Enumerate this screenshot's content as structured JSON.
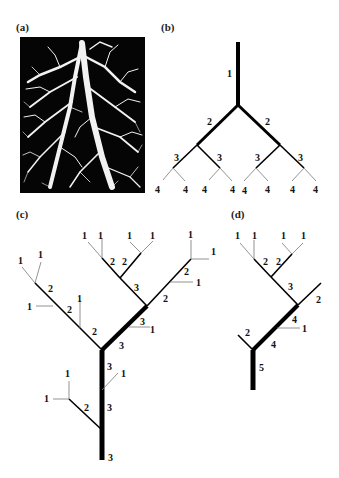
{
  "panels": {
    "a": {
      "label": "(a)",
      "caption": "root system photograph"
    },
    "b": {
      "label": "(b)"
    },
    "c": {
      "label": "(c)"
    },
    "d": {
      "label": "(d)"
    }
  },
  "tree_b": {
    "description": "Symmetric binary tree, Strahler ordering",
    "segments": [
      {
        "x1": 238,
        "y1": 42,
        "x2": 238,
        "y2": 105,
        "w": 4
      },
      {
        "x1": 238,
        "y1": 105,
        "x2": 197,
        "y2": 145,
        "w": 3
      },
      {
        "x1": 238,
        "y1": 105,
        "x2": 280,
        "y2": 145,
        "w": 3
      },
      {
        "x1": 197,
        "y1": 145,
        "x2": 173,
        "y2": 168,
        "w": 1.6
      },
      {
        "x1": 197,
        "y1": 145,
        "x2": 220,
        "y2": 168,
        "w": 1.6
      },
      {
        "x1": 280,
        "y1": 145,
        "x2": 256,
        "y2": 168,
        "w": 1.6
      },
      {
        "x1": 280,
        "y1": 145,
        "x2": 304,
        "y2": 168,
        "w": 1.6
      },
      {
        "x1": 173,
        "y1": 168,
        "x2": 163,
        "y2": 180,
        "w": 0.8
      },
      {
        "x1": 173,
        "y1": 168,
        "x2": 185,
        "y2": 181,
        "w": 0.8
      },
      {
        "x1": 220,
        "y1": 168,
        "x2": 209,
        "y2": 180,
        "w": 0.8
      },
      {
        "x1": 220,
        "y1": 168,
        "x2": 232,
        "y2": 181,
        "w": 0.8
      },
      {
        "x1": 256,
        "y1": 168,
        "x2": 244,
        "y2": 181,
        "w": 0.8
      },
      {
        "x1": 256,
        "y1": 168,
        "x2": 268,
        "y2": 181,
        "w": 0.8
      },
      {
        "x1": 304,
        "y1": 168,
        "x2": 292,
        "y2": 181,
        "w": 0.8
      },
      {
        "x1": 304,
        "y1": 168,
        "x2": 316,
        "y2": 181,
        "w": 0.8
      }
    ],
    "labels": [
      {
        "x": 227,
        "y": 77,
        "t": "1"
      },
      {
        "x": 207,
        "y": 125,
        "t": "2"
      },
      {
        "x": 265,
        "y": 125,
        "t": "2"
      },
      {
        "x": 174,
        "y": 161,
        "t": "3"
      },
      {
        "x": 217,
        "y": 161,
        "t": "3"
      },
      {
        "x": 255,
        "y": 161,
        "t": "3"
      },
      {
        "x": 298,
        "y": 161,
        "t": "3"
      },
      {
        "x": 155,
        "y": 193,
        "t": "4"
      },
      {
        "x": 183,
        "y": 193,
        "t": "4"
      },
      {
        "x": 202,
        "y": 193,
        "t": "4"
      },
      {
        "x": 230,
        "y": 193,
        "t": "4"
      },
      {
        "x": 242,
        "y": 194,
        "t": "4"
      },
      {
        "x": 265,
        "y": 193,
        "t": "4"
      },
      {
        "x": 290,
        "y": 193,
        "t": "4"
      },
      {
        "x": 313,
        "y": 193,
        "t": "4"
      }
    ]
  },
  "tree_c": {
    "description": "Irregular tree with stream orders",
    "segments": [
      {
        "x1": 102,
        "y1": 460,
        "x2": 102,
        "y2": 350,
        "w": 5
      },
      {
        "x1": 102,
        "y1": 350,
        "x2": 147,
        "y2": 306,
        "w": 4.5
      },
      {
        "x1": 102,
        "y1": 350,
        "x2": 35,
        "y2": 283,
        "w": 1.6
      },
      {
        "x1": 35,
        "y1": 283,
        "x2": 22,
        "y2": 267,
        "w": 0.8
      },
      {
        "x1": 35,
        "y1": 283,
        "x2": 41,
        "y2": 262,
        "w": 0.8
      },
      {
        "x1": 53,
        "y1": 306,
        "x2": 36,
        "y2": 306,
        "w": 0.8
      },
      {
        "x1": 80,
        "y1": 328,
        "x2": 80,
        "y2": 300,
        "w": 0.8
      },
      {
        "x1": 147,
        "y1": 306,
        "x2": 120,
        "y2": 278,
        "w": 1.6
      },
      {
        "x1": 120,
        "y1": 278,
        "x2": 102,
        "y2": 258,
        "w": 1.6
      },
      {
        "x1": 102,
        "y1": 258,
        "x2": 88,
        "y2": 242,
        "w": 0.8
      },
      {
        "x1": 102,
        "y1": 258,
        "x2": 102,
        "y2": 238,
        "w": 0.8
      },
      {
        "x1": 120,
        "y1": 278,
        "x2": 141,
        "y2": 253,
        "w": 1.6
      },
      {
        "x1": 141,
        "y1": 253,
        "x2": 130,
        "y2": 242,
        "w": 0.8
      },
      {
        "x1": 141,
        "y1": 253,
        "x2": 153,
        "y2": 241,
        "w": 0.8
      },
      {
        "x1": 147,
        "y1": 306,
        "x2": 191,
        "y2": 259,
        "w": 1.6
      },
      {
        "x1": 191,
        "y1": 259,
        "x2": 191,
        "y2": 240,
        "w": 0.8
      },
      {
        "x1": 191,
        "y1": 259,
        "x2": 209,
        "y2": 259,
        "w": 0.8
      },
      {
        "x1": 170,
        "y1": 282,
        "x2": 193,
        "y2": 282,
        "w": 0.8
      },
      {
        "x1": 129,
        "y1": 327,
        "x2": 150,
        "y2": 327,
        "w": 0.8
      },
      {
        "x1": 102,
        "y1": 390,
        "x2": 118,
        "y2": 373,
        "w": 0.8
      },
      {
        "x1": 102,
        "y1": 430,
        "x2": 69,
        "y2": 399,
        "w": 1.6
      },
      {
        "x1": 69,
        "y1": 399,
        "x2": 69,
        "y2": 381,
        "w": 0.8
      },
      {
        "x1": 69,
        "y1": 399,
        "x2": 53,
        "y2": 399,
        "w": 0.8
      }
    ],
    "labels": [
      {
        "x": 18,
        "y": 264,
        "t": "1"
      },
      {
        "x": 38,
        "y": 258,
        "t": "1"
      },
      {
        "x": 48,
        "y": 292,
        "t": "2"
      },
      {
        "x": 27,
        "y": 310,
        "t": "1"
      },
      {
        "x": 67,
        "y": 313,
        "t": "2"
      },
      {
        "x": 77,
        "y": 302,
        "t": "1"
      },
      {
        "x": 92,
        "y": 335,
        "t": "2"
      },
      {
        "x": 82,
        "y": 239,
        "t": "1"
      },
      {
        "x": 98,
        "y": 239,
        "t": "1"
      },
      {
        "x": 110,
        "y": 265,
        "t": "2"
      },
      {
        "x": 122,
        "y": 265,
        "t": "2"
      },
      {
        "x": 127,
        "y": 239,
        "t": "1"
      },
      {
        "x": 150,
        "y": 239,
        "t": "1"
      },
      {
        "x": 134,
        "y": 291,
        "t": "3"
      },
      {
        "x": 188,
        "y": 238,
        "t": "1"
      },
      {
        "x": 211,
        "y": 255,
        "t": "1"
      },
      {
        "x": 184,
        "y": 275,
        "t": "2"
      },
      {
        "x": 196,
        "y": 286,
        "t": "1"
      },
      {
        "x": 163,
        "y": 302,
        "t": "2"
      },
      {
        "x": 140,
        "y": 325,
        "t": "3"
      },
      {
        "x": 150,
        "y": 333,
        "t": "1"
      },
      {
        "x": 119,
        "y": 349,
        "t": "3"
      },
      {
        "x": 107,
        "y": 370,
        "t": "3"
      },
      {
        "x": 121,
        "y": 377,
        "t": "1"
      },
      {
        "x": 65,
        "y": 377,
        "t": "1"
      },
      {
        "x": 44,
        "y": 402,
        "t": "1"
      },
      {
        "x": 84,
        "y": 411,
        "t": "2"
      },
      {
        "x": 107,
        "y": 411,
        "t": "3"
      },
      {
        "x": 108,
        "y": 461,
        "t": "3"
      }
    ]
  },
  "tree_d": {
    "description": "Tree with Horton ordering",
    "segments": [
      {
        "x1": 253,
        "y1": 390,
        "x2": 253,
        "y2": 350,
        "w": 5
      },
      {
        "x1": 253,
        "y1": 350,
        "x2": 238,
        "y2": 335,
        "w": 1.6
      },
      {
        "x1": 253,
        "y1": 350,
        "x2": 298,
        "y2": 305,
        "w": 4
      },
      {
        "x1": 298,
        "y1": 305,
        "x2": 321,
        "y2": 283,
        "w": 1.6
      },
      {
        "x1": 277,
        "y1": 328,
        "x2": 300,
        "y2": 328,
        "w": 0.8
      },
      {
        "x1": 298,
        "y1": 305,
        "x2": 271,
        "y2": 277,
        "w": 1.6
      },
      {
        "x1": 271,
        "y1": 277,
        "x2": 254,
        "y2": 259,
        "w": 1.6
      },
      {
        "x1": 254,
        "y1": 259,
        "x2": 240,
        "y2": 243,
        "w": 0.8
      },
      {
        "x1": 254,
        "y1": 259,
        "x2": 254,
        "y2": 240,
        "w": 0.8
      },
      {
        "x1": 271,
        "y1": 277,
        "x2": 292,
        "y2": 254,
        "w": 1.6
      },
      {
        "x1": 292,
        "y1": 254,
        "x2": 282,
        "y2": 243,
        "w": 0.8
      },
      {
        "x1": 292,
        "y1": 254,
        "x2": 303,
        "y2": 243,
        "w": 0.8
      }
    ],
    "labels": [
      {
        "x": 235,
        "y": 239,
        "t": "1"
      },
      {
        "x": 252,
        "y": 239,
        "t": "1"
      },
      {
        "x": 281,
        "y": 239,
        "t": "1"
      },
      {
        "x": 301,
        "y": 239,
        "t": "1"
      },
      {
        "x": 263,
        "y": 265,
        "t": "2"
      },
      {
        "x": 276,
        "y": 265,
        "t": "2"
      },
      {
        "x": 288,
        "y": 290,
        "t": "3"
      },
      {
        "x": 316,
        "y": 303,
        "t": "2"
      },
      {
        "x": 292,
        "y": 323,
        "t": "4"
      },
      {
        "x": 302,
        "y": 332,
        "t": "1"
      },
      {
        "x": 271,
        "y": 348,
        "t": "4"
      },
      {
        "x": 245,
        "y": 336,
        "t": "2"
      },
      {
        "x": 259,
        "y": 371,
        "t": "5"
      }
    ]
  },
  "panel_label_positions": {
    "a": {
      "x": 16,
      "y": 21
    },
    "b": {
      "x": 161,
      "y": 21
    },
    "c": {
      "x": 16,
      "y": 208
    },
    "d": {
      "x": 231,
      "y": 208
    }
  }
}
